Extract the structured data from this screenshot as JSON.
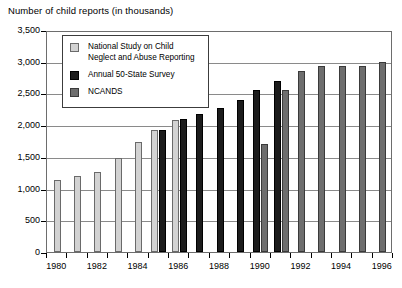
{
  "chart_data": {
    "type": "bar",
    "title": "Number of child reports (in thousands)",
    "xlabel": "",
    "ylabel": "Number of child reports (in thousands)",
    "ylim": [
      0,
      3500
    ],
    "ytick_step": 500,
    "ytick_labels": [
      "3,500",
      "3,000",
      "2,500",
      "2,000",
      "1,500",
      "1,000",
      "500",
      "0"
    ],
    "ytick_values": [
      3500,
      3000,
      2500,
      2000,
      1500,
      1000,
      500,
      0
    ],
    "x": [
      1980,
      1981,
      1982,
      1983,
      1984,
      1985,
      1986,
      1987,
      1988,
      1989,
      1990,
      1991,
      1992,
      1993,
      1994,
      1995,
      1996
    ],
    "xtick_labels": [
      "1980",
      "1982",
      "1984",
      "1986",
      "1988",
      "1990",
      "1992",
      "1994",
      "1996"
    ],
    "xtick_values": [
      1980,
      1982,
      1984,
      1986,
      1988,
      1990,
      1992,
      1994,
      1996
    ],
    "grid": true,
    "legend_position": "upper-left-inside",
    "series": [
      {
        "name": "National Study on Child Neglect and Abuse Reporting",
        "color": "#d2d2d2",
        "points": [
          {
            "x": 1980,
            "y": 1130
          },
          {
            "x": 1981,
            "y": 1200
          },
          {
            "x": 1982,
            "y": 1260
          },
          {
            "x": 1983,
            "y": 1480
          },
          {
            "x": 1984,
            "y": 1730
          },
          {
            "x": 1985,
            "y": 1930
          },
          {
            "x": 1986,
            "y": 2080
          }
        ]
      },
      {
        "name": "Annual 50-State Survey",
        "color": "#1c1c1c",
        "points": [
          {
            "x": 1985,
            "y": 1920
          },
          {
            "x": 1986,
            "y": 2090
          },
          {
            "x": 1987,
            "y": 2180
          },
          {
            "x": 1988,
            "y": 2270
          },
          {
            "x": 1989,
            "y": 2400
          },
          {
            "x": 1990,
            "y": 2560
          },
          {
            "x": 1991,
            "y": 2690
          }
        ]
      },
      {
        "name": "NCANDS",
        "color": "#6e6e6e",
        "points": [
          {
            "x": 1990,
            "y": 1700
          },
          {
            "x": 1991,
            "y": 2560
          },
          {
            "x": 1992,
            "y": 2860
          },
          {
            "x": 1993,
            "y": 2940
          },
          {
            "x": 1994,
            "y": 2930
          },
          {
            "x": 1995,
            "y": 2930
          },
          {
            "x": 1996,
            "y": 3000
          }
        ]
      }
    ]
  },
  "legend": {
    "entries": [
      {
        "label": "National Study on Child\nNeglect and Abuse Reporting",
        "swatch": "s0"
      },
      {
        "label": "Annual 50-State Survey",
        "swatch": "s1"
      },
      {
        "label": "NCANDS",
        "swatch": "s2"
      }
    ]
  }
}
